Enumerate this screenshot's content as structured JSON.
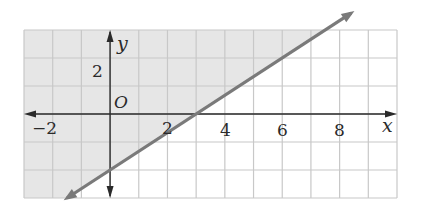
{
  "chart_data": {
    "type": "line",
    "title": "",
    "xlabel": "x",
    "ylabel": "y",
    "origin_label": "O",
    "xlim": [
      -3,
      10
    ],
    "ylim": [
      -3,
      3
    ],
    "grid": true,
    "grid_step": 1,
    "x_tick_labels": [
      {
        "value": -2,
        "label": "−2"
      },
      {
        "value": 2,
        "label": "2"
      },
      {
        "value": 4,
        "label": "4"
      },
      {
        "value": 6,
        "label": "6"
      },
      {
        "value": 8,
        "label": "8"
      }
    ],
    "y_tick_labels": [
      {
        "value": 2,
        "label": "2"
      }
    ],
    "series": [
      {
        "name": "boundary",
        "equation": "y = (2/3)x - 2",
        "slope": 0.6667,
        "intercept": -2,
        "style": "solid",
        "arrows": "both",
        "x": [
          -1.5,
          0,
          3,
          6,
          8.4
        ],
        "y": [
          -3,
          -2,
          0,
          2,
          3.6
        ]
      }
    ],
    "shaded_region": "above line",
    "colors": {
      "shade": "#e6e6e6",
      "grid": "#c8c8c8",
      "line": "#7a7a7a",
      "axis": "#2a2a2a"
    }
  },
  "labels": {
    "x_axis": "x",
    "y_axis": "y",
    "origin": "O",
    "xt_m2": "−2",
    "xt_2": "2",
    "xt_4": "4",
    "xt_6": "6",
    "xt_8": "8",
    "yt_2": "2"
  }
}
